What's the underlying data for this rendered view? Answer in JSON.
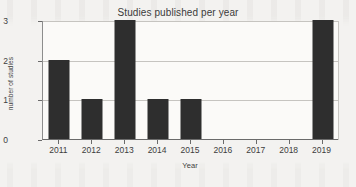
{
  "chart_data": {
    "type": "bar",
    "title": "Studies published per year",
    "xlabel": "Year",
    "ylabel": "number of studies",
    "categories": [
      "2011",
      "2012",
      "2013",
      "2014",
      "2015",
      "2016",
      "2017",
      "2018",
      "2019"
    ],
    "values": [
      2,
      1,
      3,
      1,
      1,
      0,
      0,
      0,
      3
    ],
    "ylim": [
      0,
      3
    ],
    "yticks": [
      "0",
      "1",
      "2",
      "3"
    ],
    "ytick_values": [
      0,
      1,
      2,
      3
    ],
    "grid": true,
    "legend": null,
    "bar_color": "#2e2e2e",
    "plot_background": "#fbfaf8",
    "page_background": "#f3f2f0"
  }
}
